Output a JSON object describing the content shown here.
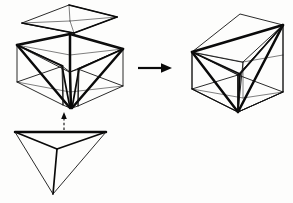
{
  "figure": {
    "background_color": "#fdfdfc",
    "ink_color": "#0a0a0a",
    "faint_ink_color": "#555555",
    "width": 293,
    "height": 203,
    "style": "line-drawing"
  },
  "parts": [
    {
      "id": "top-pyramid",
      "name": "top-pyramid-piece",
      "description": "Flattened pyramid formed from the top face of the cube with an apex at the cube centre",
      "position": "upper-left",
      "line_weight": "mixed-thin-and-thick"
    },
    {
      "id": "notched-cube-body",
      "name": "notched-cube-body",
      "description": "Cube shell with a tetrahedral void carved out, three thick V shaped edges converge at the bottom vertex",
      "position": "middle-left",
      "line_weight": "mixed-thin-and-thick"
    },
    {
      "id": "bottom-tetrahedron",
      "name": "bottom-tetrahedron-piece",
      "description": "Tetrahedron with downward apex, detached below the notched cube body",
      "position": "lower-left",
      "line_weight": "mixed-thin-and-thick"
    },
    {
      "id": "assembled-cube",
      "name": "assembled-cube-with-inscribed-tetrahedron",
      "description": "Complete cube with the inscribed tetrahedron drawn in heavy lines",
      "position": "right",
      "line_weight": "mixed-thin-and-thick"
    }
  ],
  "annotations": {
    "transform_arrow": {
      "name": "right-arrow",
      "direction": "right",
      "label": ""
    },
    "insert_arrow": {
      "name": "up-arrow",
      "direction": "up",
      "style": "dashed",
      "label": ""
    }
  },
  "labels": {
    "top_piece": "",
    "body_piece": "",
    "bottom_piece": "",
    "result": ""
  }
}
